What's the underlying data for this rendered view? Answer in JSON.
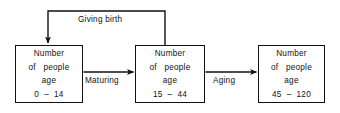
{
  "diagram": {
    "background_color": "#ffffff",
    "line_color": "#111111",
    "nodes": [
      {
        "id": "cohort-young",
        "lines": [
          "Number",
          "of   people",
          "age",
          "0  –  14"
        ],
        "age_range": "0 – 14",
        "x": 15,
        "y": 45,
        "width": 68,
        "height": 58
      },
      {
        "id": "cohort-adult",
        "lines": [
          "Number",
          "of   people",
          "age",
          "15  –  44"
        ],
        "age_range": "15 – 44",
        "x": 135,
        "y": 45,
        "width": 70,
        "height": 58
      },
      {
        "id": "cohort-senior",
        "lines": [
          "Number",
          "of   people",
          "age",
          "45  –  120"
        ],
        "age_range": "45 – 120",
        "x": 258,
        "y": 45,
        "width": 67,
        "height": 58
      }
    ],
    "edges": [
      {
        "id": "giving-birth",
        "label": "Giving birth",
        "from": "cohort-adult",
        "to": "cohort-young",
        "label_x": 78,
        "label_y": 15
      },
      {
        "id": "maturing",
        "label": "Maturing",
        "from": "cohort-young",
        "to": "cohort-adult",
        "label_x": 85,
        "label_y": 76
      },
      {
        "id": "aging",
        "label": "Aging",
        "from": "cohort-adult",
        "to": "cohort-senior",
        "label_x": 213,
        "label_y": 76
      }
    ]
  }
}
